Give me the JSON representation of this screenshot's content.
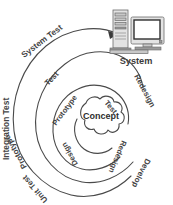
{
  "diagram": {
    "background_color": "#ffffff",
    "line_color": "#4a4a4a",
    "text_color": "#444444",
    "center": {
      "label": "Concept",
      "shape": "cloud-icon"
    },
    "output": {
      "label": "System",
      "icon": "computer-system-icon"
    },
    "arrow": {
      "name": "spiral-exit-arrow",
      "points_to": "System"
    },
    "rings": [
      {
        "name": "inner-ring",
        "labels": [
          {
            "text": "Test",
            "position": "upper-right"
          },
          {
            "text": "Redesign",
            "position": "lower-right"
          },
          {
            "text": "Design",
            "position": "lower-left"
          },
          {
            "text": "Prototype",
            "position": "upper-left"
          }
        ]
      },
      {
        "name": "middle-ring",
        "labels": [
          {
            "text": "Redesign",
            "position": "right"
          },
          {
            "text": "Develop",
            "position": "lower-right"
          },
          {
            "text": "Unit Test",
            "position": "lower-left"
          },
          {
            "text": "Test",
            "position": "upper-left"
          }
        ]
      },
      {
        "name": "outer-ring",
        "labels": [
          {
            "text": "System Test",
            "position": "upper-left"
          },
          {
            "text": "Integration Test",
            "position": "left"
          }
        ]
      }
    ],
    "all_labels": [
      "System Test",
      "Integration Test",
      "Unit Test",
      "Test",
      "Prototype",
      "Design",
      "Redesign",
      "Develop",
      "Concept",
      "System"
    ]
  }
}
